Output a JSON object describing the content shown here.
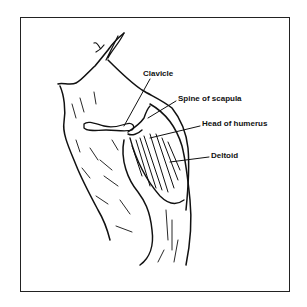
{
  "figure": {
    "labels": [
      {
        "id": "clavicle",
        "text": "Clavicle"
      },
      {
        "id": "spine-of-scapula",
        "text": "Spine of scapula"
      },
      {
        "id": "head-of-humerus",
        "text": "Head of humerus"
      },
      {
        "id": "deltoid",
        "text": "Deltoid"
      }
    ]
  },
  "colors": {
    "ink": "#111111",
    "background": "#ffffff",
    "frame": "#222222"
  }
}
